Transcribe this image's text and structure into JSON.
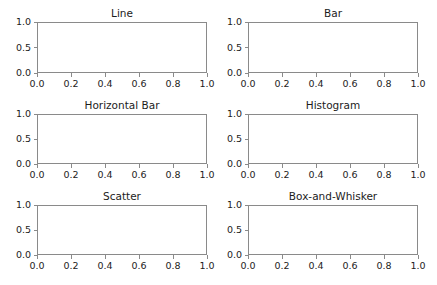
{
  "figure": {
    "width": 437,
    "height": 285,
    "facecolor": "#ffffff",
    "spine_color": "#8a8a8a",
    "text_color": "#222222",
    "title_color": "#1c1c1c",
    "nrows": 3,
    "ncols": 2
  },
  "chart_data": [
    {
      "type": "line",
      "title": "Line",
      "xlabel": "",
      "ylabel": "",
      "xlim": [
        0.0,
        1.0
      ],
      "ylim": [
        0.0,
        1.0
      ],
      "xticks": [
        "0.0",
        "0.2",
        "0.4",
        "0.6",
        "0.8",
        "1.0"
      ],
      "xtick_values": [
        0.0,
        0.2,
        0.4,
        0.6,
        0.8,
        1.0
      ],
      "yticks": [
        "0.0",
        "0.5",
        "1.0"
      ],
      "ytick_values": [
        0.0,
        0.5,
        1.0
      ],
      "grid": false,
      "legend": null,
      "series": [],
      "annotations": []
    },
    {
      "type": "bar",
      "title": "Bar",
      "xlabel": "",
      "ylabel": "",
      "xlim": [
        0.0,
        1.0
      ],
      "ylim": [
        0.0,
        1.0
      ],
      "xticks": [
        "0.0",
        "0.2",
        "0.4",
        "0.6",
        "0.8",
        "1.0"
      ],
      "xtick_values": [
        0.0,
        0.2,
        0.4,
        0.6,
        0.8,
        1.0
      ],
      "yticks": [
        "0.0",
        "0.5",
        "1.0"
      ],
      "ytick_values": [
        0.0,
        0.5,
        1.0
      ],
      "grid": false,
      "legend": null,
      "categories": [],
      "values": [],
      "annotations": []
    },
    {
      "type": "bar",
      "title": "Horizontal Bar",
      "xlabel": "",
      "ylabel": "",
      "xlim": [
        0.0,
        1.0
      ],
      "ylim": [
        0.0,
        1.0
      ],
      "xticks": [
        "0.0",
        "0.2",
        "0.4",
        "0.6",
        "0.8",
        "1.0"
      ],
      "xtick_values": [
        0.0,
        0.2,
        0.4,
        0.6,
        0.8,
        1.0
      ],
      "yticks": [
        "0.0",
        "0.5",
        "1.0"
      ],
      "ytick_values": [
        0.0,
        0.5,
        1.0
      ],
      "grid": false,
      "legend": null,
      "categories": [],
      "values": [],
      "annotations": []
    },
    {
      "type": "bar",
      "title": "Histogram",
      "xlabel": "",
      "ylabel": "",
      "xlim": [
        0.0,
        1.0
      ],
      "ylim": [
        0.0,
        1.0
      ],
      "xticks": [
        "0.0",
        "0.2",
        "0.4",
        "0.6",
        "0.8",
        "1.0"
      ],
      "xtick_values": [
        0.0,
        0.2,
        0.4,
        0.6,
        0.8,
        1.0
      ],
      "yticks": [
        "0.0",
        "0.5",
        "1.0"
      ],
      "ytick_values": [
        0.0,
        0.5,
        1.0
      ],
      "grid": false,
      "legend": null,
      "bins": [],
      "counts": [],
      "annotations": []
    },
    {
      "type": "scatter",
      "title": "Scatter",
      "xlabel": "",
      "ylabel": "",
      "xlim": [
        0.0,
        1.0
      ],
      "ylim": [
        0.0,
        1.0
      ],
      "xticks": [
        "0.0",
        "0.2",
        "0.4",
        "0.6",
        "0.8",
        "1.0"
      ],
      "xtick_values": [
        0.0,
        0.2,
        0.4,
        0.6,
        0.8,
        1.0
      ],
      "yticks": [
        "0.0",
        "0.5",
        "1.0"
      ],
      "ytick_values": [
        0.0,
        0.5,
        1.0
      ],
      "grid": false,
      "legend": null,
      "points": [],
      "annotations": []
    },
    {
      "type": "box",
      "title": "Box-and-Whisker",
      "xlabel": "",
      "ylabel": "",
      "xlim": [
        0.0,
        1.0
      ],
      "ylim": [
        0.0,
        1.0
      ],
      "xticks": [
        "0.0",
        "0.2",
        "0.4",
        "0.6",
        "0.8",
        "1.0"
      ],
      "xtick_values": [
        0.0,
        0.2,
        0.4,
        0.6,
        0.8,
        1.0
      ],
      "yticks": [
        "0.0",
        "0.5",
        "1.0"
      ],
      "ytick_values": [
        0.0,
        0.5,
        1.0
      ],
      "grid": false,
      "legend": null,
      "boxes": [],
      "annotations": []
    }
  ],
  "layout": {
    "axes_boxes": [
      {
        "left": 37,
        "top": 22,
        "width": 170,
        "height": 51
      },
      {
        "left": 248,
        "top": 22,
        "width": 170,
        "height": 51
      },
      {
        "left": 37,
        "top": 114,
        "width": 170,
        "height": 50
      },
      {
        "left": 248,
        "top": 114,
        "width": 170,
        "height": 50
      },
      {
        "left": 37,
        "top": 205,
        "width": 170,
        "height": 50
      },
      {
        "left": 248,
        "top": 205,
        "width": 170,
        "height": 50
      }
    ]
  }
}
